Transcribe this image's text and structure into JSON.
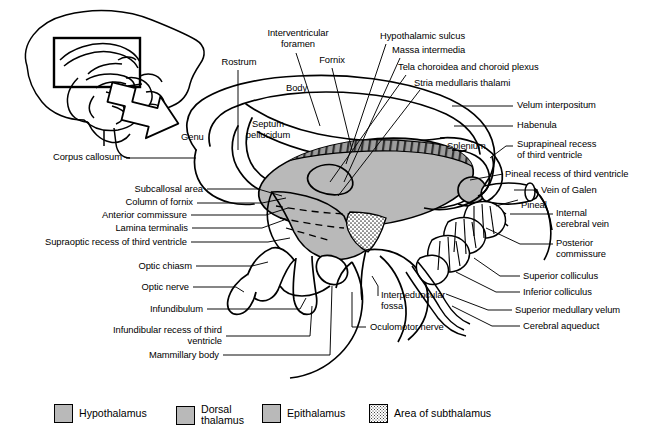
{
  "figure": {
    "background_color": "#ffffff",
    "line_color": "#000000",
    "fill_gray": "#b9b9b9",
    "fill_gray_dark": "#a8a8a8",
    "width": 647,
    "height": 448
  },
  "inset": {
    "name": "sagittal-brain-orientation-inset",
    "description": "Small lateral brain outline with rectangular region-of-interest box and arrow pointing to the enlarged main drawing"
  },
  "labels": {
    "rostrum": "Rostrum",
    "interventricular_foramen": "Interventricular\nforamen",
    "fornix": "Fornix",
    "hypothalamic_sulcus": "Hypothalamic sulcus",
    "massa_intermedia": "Massa intermedia",
    "tela_choroidea": "Tela choroidea and choroid plexus",
    "stria_medullaris": "Stria medullaris thalami",
    "velum_interpositum": "Velum interpositum",
    "habenula": "Habenula",
    "suprapineal_recess": "Suprapineal recess\nof third ventricle",
    "pineal_recess": "Pineal recess of third ventricle",
    "vein_of_galen": "Vein of Galen",
    "pineal": "Pineal",
    "internal_cerebral_vein": "Internal\ncerebral vein",
    "posterior_commissure": "Posterior\ncommissure",
    "superior_colliculus": "Superior colliculus",
    "inferior_colliculus": "Inferior colliculus",
    "superior_medullary_velum": "Superior medullary velum",
    "cerebral_aqueduct": "Cerebral aqueduct",
    "body": "Body",
    "genu": "Genu",
    "septum_pellucidum": "Septum\npellucidum",
    "splenium": "Splenium",
    "corpus_callosum": "Corpus callosum",
    "subcallosal_area": "Subcallosal area",
    "column_of_fornix": "Column of fornix",
    "anterior_commissure": "Anterior commissure",
    "lamina_terminalis": "Lamina terminalis",
    "supraoptic_recess": "Supraoptic recess of third ventricle",
    "optic_chiasm": "Optic chiasm",
    "optic_nerve": "Optic nerve",
    "infundibulum": "Infundibulum",
    "infundibular_recess": "Infundibular recess of third\nventricle",
    "mammillary_body": "Mammillary body",
    "interpeduncular_fossa": "Interpeduncular\nfossa",
    "oculomotor_nerve": "Oculomotor nerve"
  },
  "legend": {
    "items": [
      {
        "label": "Hypothalamus",
        "swatch": "solid-gray",
        "color": "#b9b9b9"
      },
      {
        "label": "Dorsal\nthalamus",
        "swatch": "solid-gray",
        "color": "#b9b9b9"
      },
      {
        "label": "Epithalamus",
        "swatch": "solid-gray",
        "color": "#b9b9b9"
      },
      {
        "label": "Area of subthalamus",
        "swatch": "stippled",
        "color": "#ffffff"
      }
    ]
  }
}
